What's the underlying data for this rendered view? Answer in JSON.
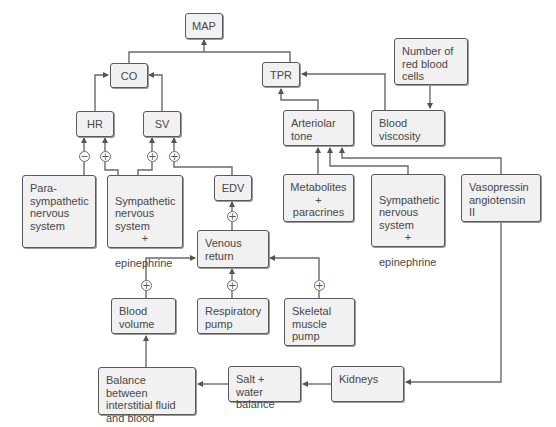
{
  "diagram": {
    "colors": {
      "box_fill": "#f1f1f1",
      "box_border": "#5a5a5a",
      "line": "#6a6a6a",
      "text": "#474747"
    },
    "nodes": {
      "map": "MAP",
      "co": "CO",
      "tpr": "TPR",
      "hr": "HR",
      "sv": "SV",
      "rbc": "Number of\nred blood\ncells",
      "viscosity": "Blood\nviscosity",
      "arteriolar": "Arteriolar\ntone",
      "para": "Para-\nsympathetic\nnervous\nsystem",
      "symp_heart": "Sympathetic\nnervous\nsystem",
      "symp_heart_plus": "+",
      "symp_heart_epi": "epinephrine",
      "edv": "EDV",
      "metabolites": "Metabolites\n+\nparacrines",
      "symp_vessel": "Sympathetic\nnervous\nsystem",
      "symp_vessel_plus": "+",
      "symp_vessel_epi": "epinephrine",
      "vasopressin": "Vasopressin\nangiotensin II",
      "venous": "Venous\nreturn",
      "blood_volume": "Blood\nvolume",
      "respiratory": "Respiratory\npump",
      "skeletal": "Skeletal\nmuscle\npump",
      "balance": "Balance between\ninterstitial fluid\nand blood",
      "salt": "Salt + water\nbalance",
      "kidneys": "Kidneys"
    },
    "signs": {
      "para_to_hr": "−",
      "symp_to_hr": "+",
      "symp_to_sv": "+",
      "edv_to_sv": "+",
      "venous_to_edv": "+",
      "bv_to_venous": "+",
      "resp_to_venous": "+",
      "skel_to_venous": "+"
    }
  }
}
